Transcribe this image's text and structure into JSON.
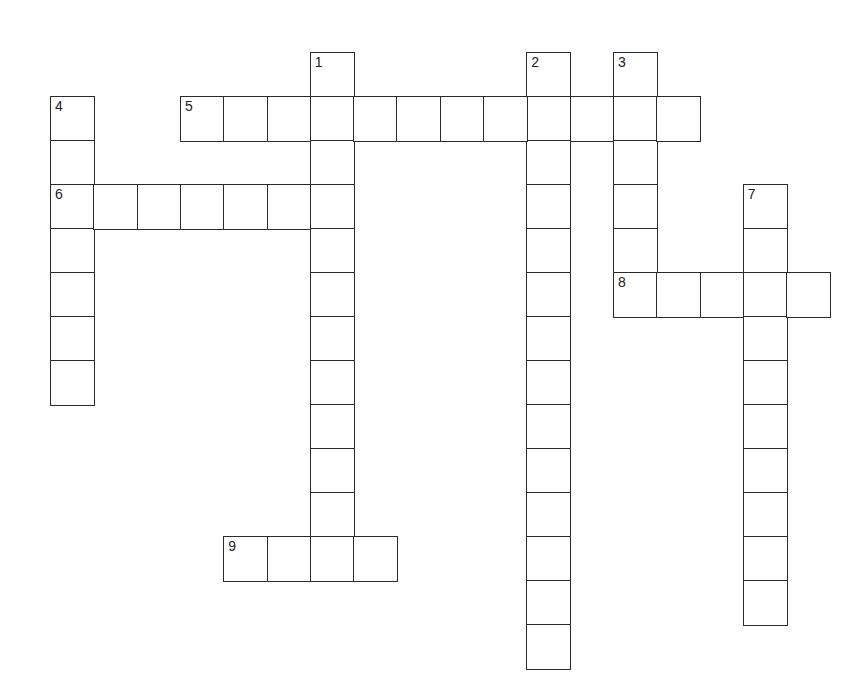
{
  "puzzle": {
    "type": "crossword",
    "grid_origin": {
      "x": 50,
      "y": 52
    },
    "cell_size": {
      "w": 43.3,
      "h": 44
    },
    "colors": {
      "border": "#2a2a2a",
      "background": "#ffffff",
      "number": "#222222"
    },
    "entries": [
      {
        "number": "1",
        "direction": "down",
        "row": 0,
        "col": 6,
        "length": 12
      },
      {
        "number": "2",
        "direction": "down",
        "row": 0,
        "col": 11,
        "length": 14
      },
      {
        "number": "3",
        "direction": "down",
        "row": 0,
        "col": 13,
        "length": 6
      },
      {
        "number": "4",
        "direction": "down",
        "row": 1,
        "col": 0,
        "length": 7
      },
      {
        "number": "5",
        "direction": "across",
        "row": 1,
        "col": 3,
        "length": 12
      },
      {
        "number": "6",
        "direction": "across",
        "row": 3,
        "col": 0,
        "length": 7
      },
      {
        "number": "7",
        "direction": "down",
        "row": 3,
        "col": 16,
        "length": 10
      },
      {
        "number": "8",
        "direction": "across",
        "row": 5,
        "col": 13,
        "length": 5
      },
      {
        "number": "9",
        "direction": "across",
        "row": 11,
        "col": 4,
        "length": 4
      }
    ]
  }
}
